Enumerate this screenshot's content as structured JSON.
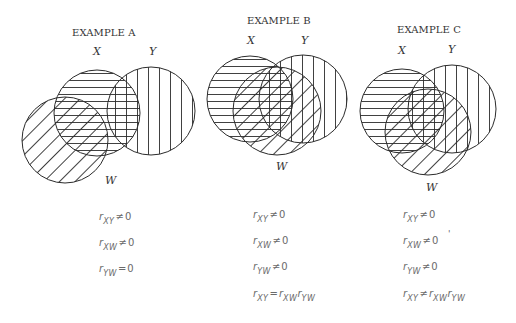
{
  "examples": [
    {
      "title": "EXAMPLE A",
      "labels": {
        "x": "X",
        "y": "Y",
        "w": "W"
      },
      "circles": {
        "X": {
          "cx": 97,
          "cy": 113,
          "r": 43,
          "hatch": "horizontal"
        },
        "Y": {
          "cx": 151,
          "cy": 111,
          "r": 44,
          "hatch": "vertical"
        },
        "W": {
          "cx": 65,
          "cy": 140,
          "r": 43,
          "hatch": "diagonal"
        }
      },
      "equations": [
        {
          "r": "r",
          "sub": "XY",
          "rel": "≠",
          "rhs": "0"
        },
        {
          "r": "r",
          "sub": "XW",
          "rel": "≠",
          "rhs": "0"
        },
        {
          "r": "r",
          "sub": "YW",
          "rel": "=",
          "rhs": "0"
        }
      ]
    },
    {
      "title": "EXAMPLE B",
      "labels": {
        "x": "X",
        "y": "Y",
        "w": "W"
      },
      "circles": {
        "X": {
          "cx": 250,
          "cy": 99,
          "r": 43,
          "hatch": "horizontal"
        },
        "Y": {
          "cx": 303,
          "cy": 99,
          "r": 44,
          "hatch": "vertical"
        },
        "W": {
          "cx": 277,
          "cy": 111,
          "r": 44,
          "hatch": "diagonal"
        }
      },
      "equations": [
        {
          "r": "r",
          "sub": "XY",
          "rel": "≠",
          "rhs": "0"
        },
        {
          "r": "r",
          "sub": "XW",
          "rel": "≠",
          "rhs": "0"
        },
        {
          "r": "r",
          "sub": "YW",
          "rel": "≠",
          "rhs": "0"
        },
        {
          "r": "r",
          "sub": "XY",
          "rel": "=",
          "rhs": "r",
          "rhs_sub": "XW",
          "rhs2": "r",
          "rhs2_sub": "YW"
        }
      ]
    },
    {
      "title": "EXAMPLE C",
      "labels": {
        "x": "X",
        "y": "Y",
        "w": "W"
      },
      "circles": {
        "X": {
          "cx": 402,
          "cy": 111,
          "r": 42,
          "hatch": "horizontal"
        },
        "Y": {
          "cx": 452,
          "cy": 109,
          "r": 44,
          "hatch": "vertical"
        },
        "W": {
          "cx": 428,
          "cy": 132,
          "r": 43,
          "hatch": "diagonal"
        }
      },
      "equations": [
        {
          "r": "r",
          "sub": "XY",
          "rel": "≠",
          "rhs": "0"
        },
        {
          "r": "r",
          "sub": "XW",
          "rel": "≠",
          "rhs": "0",
          "mark": "'"
        },
        {
          "r": "r",
          "sub": "YW",
          "rel": "≠",
          "rhs": "0"
        },
        {
          "r": "r",
          "sub": "XY",
          "rel": "≠",
          "rhs": "r",
          "rhs_sub": "XW",
          "rhs2": "r",
          "rhs2_sub": "YW"
        }
      ]
    }
  ],
  "colors": {
    "stroke": "#2b2b2b",
    "text": "#333333",
    "equation_text": "#6a6a6a",
    "background": "#ffffff"
  }
}
